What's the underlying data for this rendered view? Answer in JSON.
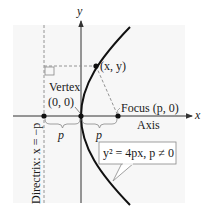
{
  "diagram": {
    "axes": {
      "x_label": "x",
      "y_label": "y"
    },
    "labels": {
      "point": "(x, y)",
      "vertex_title": "Vertex",
      "vertex_coords": "(0, 0)",
      "focus": "Focus (p, 0)",
      "axis": "Axis",
      "directrix": "Directrix: x = −p",
      "distance_left": "p",
      "distance_right": "p",
      "equation": "y² = 4px, p ≠ 0"
    },
    "colors": {
      "curve": "#111111",
      "axes": "#333333",
      "dashed": "#888888",
      "background_panel": "#f7f7f7",
      "point": "#111111"
    }
  }
}
